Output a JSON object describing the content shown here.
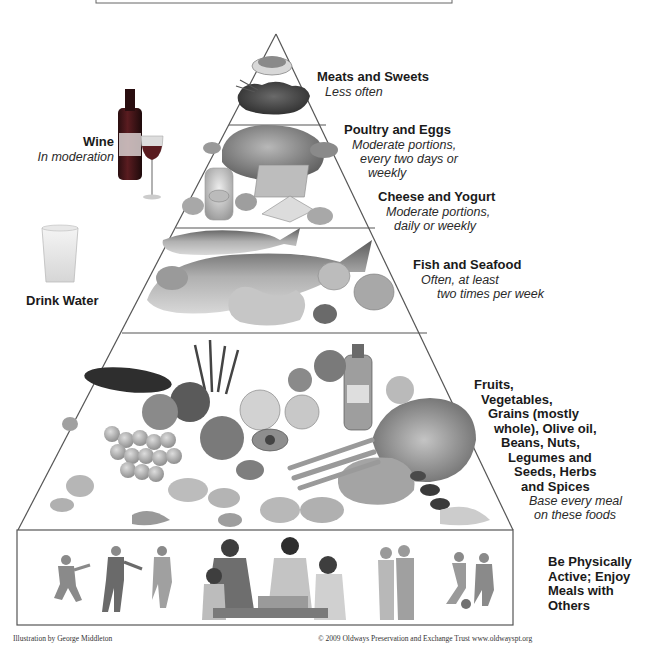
{
  "diagram": {
    "type": "food-pyramid",
    "title_box": {
      "visible": true,
      "text": ""
    },
    "tiers": [
      {
        "name": "Meats and Sweets",
        "note": "Less often"
      },
      {
        "name": "Poultry and Eggs",
        "note_lines": [
          "Moderate portions,",
          "every two days or",
          "weekly"
        ]
      },
      {
        "name": "Cheese and Yogurt",
        "note_lines": [
          "Moderate portions,",
          "daily or weekly"
        ]
      },
      {
        "name": "Fish and Seafood",
        "note_lines": [
          "Often, at least",
          "two times per week"
        ]
      },
      {
        "name_lines": [
          "Fruits,",
          "Vegetables,",
          "Grains (mostly",
          "whole), Olive oil,",
          "Beans, Nuts,",
          "Legumes and",
          "Seeds, Herbs",
          "and Spices"
        ],
        "note_lines": [
          "Base every meal",
          "on these foods"
        ]
      }
    ],
    "base": {
      "lines": [
        "Be Physically",
        "Active; Enjoy",
        "Meals with",
        "Others"
      ]
    },
    "side_items": {
      "wine": {
        "name": "Wine",
        "note": "In moderation"
      },
      "water": {
        "name": "Drink Water"
      }
    },
    "credits": {
      "illustrator": "Illustration by George Middleton",
      "copyright": "© 2009 Oldways Preservation and Exchange Trust",
      "website": "www.oldwayspt.org"
    },
    "colors": {
      "line": "#555555",
      "text": "#1a1a1a",
      "background": "#ffffff",
      "wine": "#4a1518"
    }
  }
}
